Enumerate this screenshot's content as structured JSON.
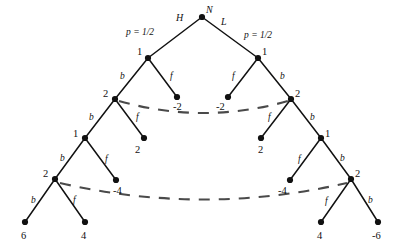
{
  "figure": {
    "root": {
      "id": "root",
      "label": "N",
      "x": 202,
      "y": 17
    },
    "branch_annotations": [
      {
        "id": "branch-H",
        "label": "H",
        "x": 176,
        "y": 13
      },
      {
        "id": "branch-L",
        "label": "L",
        "x": 221,
        "y": 17
      },
      {
        "id": "prob-left",
        "label": "p = 1/2",
        "x": 126,
        "y": 28
      },
      {
        "id": "prob-right",
        "label": "p = 1/2",
        "x": 244,
        "y": 31
      }
    ],
    "nodes": [
      {
        "id": "n-L1",
        "label": "1",
        "x": 148,
        "y": 58,
        "label_dx": -11,
        "label_dy": -11
      },
      {
        "id": "n-R1",
        "label": "1",
        "x": 258,
        "y": 58,
        "label_dx": 4,
        "label_dy": -11
      },
      {
        "id": "n-L2",
        "label": "2",
        "x": 115,
        "y": 99,
        "label_dx": -12,
        "label_dy": -10
      },
      {
        "id": "n-R2",
        "label": "2",
        "x": 291,
        "y": 99,
        "label_dx": 4,
        "label_dy": -10
      },
      {
        "id": "n-L3",
        "label": "1",
        "x": 85,
        "y": 138,
        "label_dx": -12,
        "label_dy": -9
      },
      {
        "id": "n-R3",
        "label": "1",
        "x": 321,
        "y": 138,
        "label_dx": 4,
        "label_dy": -9
      },
      {
        "id": "n-L4",
        "label": "2",
        "x": 55,
        "y": 179,
        "label_dx": -12,
        "label_dy": -10
      },
      {
        "id": "n-R4",
        "label": "2",
        "x": 351,
        "y": 179,
        "label_dx": 4,
        "label_dy": -10
      }
    ],
    "leaves": [
      {
        "id": "leaf-neg2-left",
        "label": "-2",
        "x": 177,
        "y": 97,
        "label_dx": -4,
        "label_dy": 5
      },
      {
        "id": "leaf-neg2-right",
        "label": "-2",
        "x": 228,
        "y": 97,
        "label_dx": -12,
        "label_dy": 5
      },
      {
        "id": "leaf-2-left",
        "label": "2",
        "x": 144,
        "y": 138,
        "label_dx": -9,
        "label_dy": 7
      },
      {
        "id": "leaf-2-right",
        "label": "2",
        "x": 261,
        "y": 138,
        "label_dx": -3,
        "label_dy": 7
      },
      {
        "id": "leaf-neg4-left",
        "label": "-4",
        "x": 116,
        "y": 180,
        "label_dx": -3,
        "label_dy": 6
      },
      {
        "id": "leaf-neg4-right",
        "label": "-4",
        "x": 290,
        "y": 180,
        "label_dx": -12,
        "label_dy": 6
      },
      {
        "id": "leaf-6",
        "label": "6",
        "x": 25,
        "y": 222,
        "label_dx": -4,
        "label_dy": 9
      },
      {
        "id": "leaf-4-left",
        "label": "4",
        "x": 85,
        "y": 222,
        "label_dx": -4,
        "label_dy": 9
      },
      {
        "id": "leaf-4-right",
        "label": "4",
        "x": 321,
        "y": 222,
        "label_dx": -4,
        "label_dy": 9
      },
      {
        "id": "leaf-neg6",
        "label": "-6",
        "x": 378,
        "y": 222,
        "label_dx": -6,
        "label_dy": 9
      }
    ],
    "edge_labels": [
      {
        "id": "edge-b-L1",
        "label": "b",
        "x": 120,
        "y": 72
      },
      {
        "id": "edge-f-L1",
        "label": "f",
        "x": 170,
        "y": 72
      },
      {
        "id": "edge-f-R1",
        "label": "f",
        "x": 232,
        "y": 72
      },
      {
        "id": "edge-b-R1",
        "label": "b",
        "x": 280,
        "y": 72
      },
      {
        "id": "edge-b-L2",
        "label": "b",
        "x": 89,
        "y": 113
      },
      {
        "id": "edge-f-L2",
        "label": "f",
        "x": 136,
        "y": 113
      },
      {
        "id": "edge-f-R2",
        "label": "f",
        "x": 268,
        "y": 113
      },
      {
        "id": "edge-b-R2",
        "label": "b",
        "x": 310,
        "y": 113
      },
      {
        "id": "edge-b-L3",
        "label": "b",
        "x": 60,
        "y": 154
      },
      {
        "id": "edge-f-L3",
        "label": "f",
        "x": 105,
        "y": 155
      },
      {
        "id": "edge-f-R3",
        "label": "f",
        "x": 298,
        "y": 155
      },
      {
        "id": "edge-b-R3",
        "label": "b",
        "x": 340,
        "y": 154
      },
      {
        "id": "edge-b-L4",
        "label": "b",
        "x": 31,
        "y": 196
      },
      {
        "id": "edge-f-L4",
        "label": "f",
        "x": 73,
        "y": 196
      },
      {
        "id": "edge-f-R4",
        "label": "f",
        "x": 325,
        "y": 197
      },
      {
        "id": "edge-b-R4",
        "label": "b",
        "x": 368,
        "y": 196
      }
    ],
    "edges": [
      {
        "id": "edge-root-left",
        "x1": 202,
        "y1": 17,
        "x2": 148,
        "y2": 58
      },
      {
        "id": "edge-root-right",
        "x1": 202,
        "y1": 17,
        "x2": 258,
        "y2": 58
      },
      {
        "id": "edge-L1-b",
        "x1": 148,
        "y1": 58,
        "x2": 115,
        "y2": 99
      },
      {
        "id": "edge-L1-f",
        "x1": 148,
        "y1": 58,
        "x2": 177,
        "y2": 97
      },
      {
        "id": "edge-R1-f",
        "x1": 258,
        "y1": 58,
        "x2": 228,
        "y2": 97
      },
      {
        "id": "edge-R1-b",
        "x1": 258,
        "y1": 58,
        "x2": 291,
        "y2": 99
      },
      {
        "id": "edge-L2-b",
        "x1": 115,
        "y1": 99,
        "x2": 85,
        "y2": 138
      },
      {
        "id": "edge-L2-f",
        "x1": 115,
        "y1": 99,
        "x2": 144,
        "y2": 138
      },
      {
        "id": "edge-R2-f",
        "x1": 291,
        "y1": 99,
        "x2": 261,
        "y2": 138
      },
      {
        "id": "edge-R2-b",
        "x1": 291,
        "y1": 99,
        "x2": 321,
        "y2": 138
      },
      {
        "id": "edge-L3-b",
        "x1": 85,
        "y1": 138,
        "x2": 55,
        "y2": 179
      },
      {
        "id": "edge-L3-f",
        "x1": 85,
        "y1": 138,
        "x2": 116,
        "y2": 180
      },
      {
        "id": "edge-R3-f",
        "x1": 321,
        "y1": 138,
        "x2": 290,
        "y2": 180
      },
      {
        "id": "edge-R3-b",
        "x1": 321,
        "y1": 138,
        "x2": 351,
        "y2": 179
      },
      {
        "id": "edge-L4-b",
        "x1": 55,
        "y1": 179,
        "x2": 25,
        "y2": 222
      },
      {
        "id": "edge-L4-f",
        "x1": 55,
        "y1": 179,
        "x2": 85,
        "y2": 222
      },
      {
        "id": "edge-R4-f",
        "x1": 351,
        "y1": 179,
        "x2": 321,
        "y2": 222
      },
      {
        "id": "edge-R4-b",
        "x1": 351,
        "y1": 179,
        "x2": 378,
        "y2": 222
      }
    ],
    "recombination_curves": [
      {
        "id": "recombine-upper",
        "path": "M 119 101 Q 203 125 288 101"
      },
      {
        "id": "recombine-lower",
        "path": "M 60 183 Q 203 216 347 183"
      }
    ],
    "colors": {
      "ink": "#111111",
      "dashed": "#4a4a4a",
      "background": "#ffffff"
    }
  }
}
